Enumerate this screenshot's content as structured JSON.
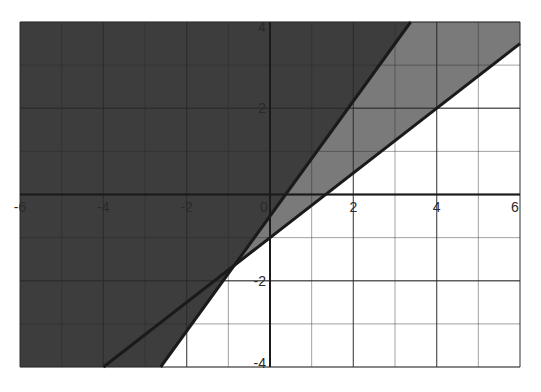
{
  "chart_data": {
    "type": "line",
    "title": "",
    "xlabel": "",
    "ylabel": "",
    "xlim": [
      -6,
      6
    ],
    "ylim": [
      -4,
      4
    ],
    "grid": true,
    "grid_step": 1,
    "major_grid_step": 2,
    "x_ticks": [
      -6,
      -4,
      -2,
      0,
      2,
      4,
      6
    ],
    "y_ticks": [
      4,
      2,
      -2,
      -4
    ],
    "x_tick_labels": [
      "-6",
      "-4",
      "-2",
      "0",
      "2",
      "4",
      "6"
    ],
    "y_tick_labels": [
      "4",
      "2",
      "-2",
      "-4"
    ],
    "series": [
      {
        "name": "steep boundary line",
        "equation": "y = (4/3)x - 0.5",
        "slope": 1.3333,
        "intercept": -0.5
      },
      {
        "name": "shallow boundary line",
        "equation": "y = 0.75x - 1",
        "slope": 0.75,
        "intercept": -1
      }
    ],
    "shaded_regions": [
      {
        "name": "above both lines",
        "color": "#3d3d3d"
      },
      {
        "name": "between lines",
        "color": "#7a7a7a"
      },
      {
        "name": "below both lines",
        "color": "#ffffff"
      }
    ],
    "intersection": {
      "x": -0.92,
      "y": -1.69
    }
  },
  "colors": {
    "dark_region": "#3d3d3d",
    "mid_region": "#7a7a7a",
    "light_region": "#ffffff",
    "line": "#1a1a1a",
    "grid": "#2a2a2a"
  }
}
